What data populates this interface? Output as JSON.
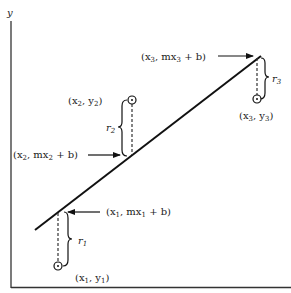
{
  "diagram": {
    "axis": {
      "y_label": "y"
    },
    "line": {
      "from": [
        35,
        230
      ],
      "to": [
        261,
        56
      ],
      "color": "#111111"
    },
    "points": [
      {
        "id": "1",
        "line_point_label": {
          "prefix": "(x",
          "sub1": "1",
          "mid": ", mx",
          "sub2": "1",
          "suffix": " + b)"
        },
        "data_point_label": {
          "prefix": "(x",
          "sub1": "1",
          "mid": ", y",
          "sub2": "1",
          "suffix": ")"
        },
        "residual_label": {
          "name": "r",
          "sub": "1"
        }
      },
      {
        "id": "2",
        "line_point_label": {
          "prefix": "(x",
          "sub1": "2",
          "mid": ", mx",
          "sub2": "2",
          "suffix": " + b)"
        },
        "data_point_label": {
          "prefix": "(x",
          "sub1": "2",
          "mid": ", y",
          "sub2": "2",
          "suffix": ")"
        },
        "residual_label": {
          "name": "r",
          "sub": "2"
        }
      },
      {
        "id": "3",
        "line_point_label": {
          "prefix": "(x",
          "sub1": "3",
          "mid": ", mx",
          "sub2": "3",
          "suffix": " + b)"
        },
        "data_point_label": {
          "prefix": "(x",
          "sub1": "3",
          "mid": ", y",
          "sub2": "3",
          "suffix": ")"
        },
        "residual_label": {
          "name": "r",
          "sub": "3"
        }
      }
    ]
  }
}
